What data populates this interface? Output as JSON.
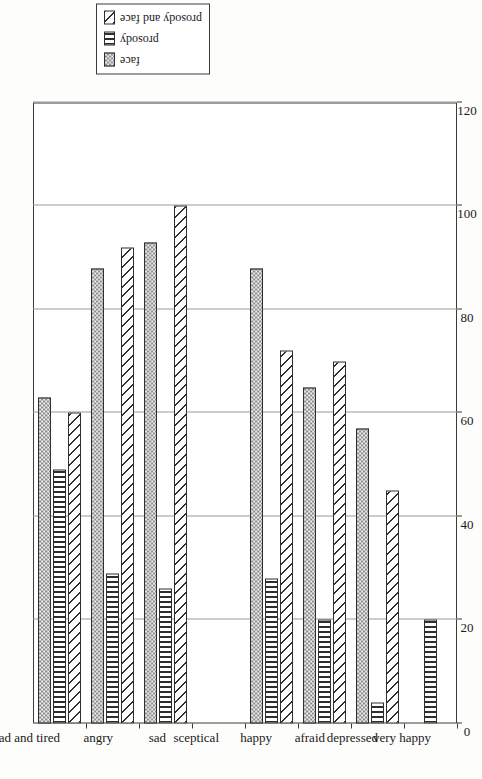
{
  "chart_data": {
    "type": "bar",
    "orientation": "vertical-rotated",
    "title": "",
    "xlabel": "",
    "ylabel": "% correct",
    "ylim": [
      0,
      120
    ],
    "yticks": [
      0,
      20,
      40,
      60,
      80,
      100,
      120
    ],
    "grid": true,
    "legend_position": "top-right",
    "categories": [
      "sad and tired",
      "angry",
      "sad",
      "sceptical",
      "happy",
      "afraid",
      "depressed",
      "very happy"
    ],
    "series": [
      {
        "name": "face",
        "pattern": "checkerboard",
        "values": [
          63,
          88,
          93,
          0,
          88,
          65,
          57,
          0
        ]
      },
      {
        "name": "prosody",
        "pattern": "vertical-lines",
        "values": [
          49,
          29,
          26,
          0,
          28,
          20,
          4,
          20
        ]
      },
      {
        "name": "prosody and face",
        "pattern": "diagonal-hatch",
        "values": [
          60,
          92,
          100,
          0,
          72,
          70,
          45,
          0
        ]
      }
    ]
  },
  "axis": {
    "value_axis_label": "% correct",
    "tick_labels": [
      "0",
      "20",
      "40",
      "60",
      "80",
      "100",
      "120"
    ]
  },
  "legend": {
    "entries": [
      {
        "label": "face"
      },
      {
        "label": "prosody"
      },
      {
        "label": "prosody and face"
      }
    ]
  },
  "categories": [
    {
      "label": "sad and tired"
    },
    {
      "label": "angry"
    },
    {
      "label": "sad"
    },
    {
      "label": "sceptical"
    },
    {
      "label": "happy"
    },
    {
      "label": "afraid"
    },
    {
      "label": "depressed"
    },
    {
      "label": "very happy"
    }
  ]
}
